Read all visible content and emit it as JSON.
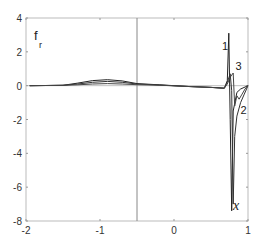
{
  "chart_data": {
    "type": "line",
    "title": "",
    "xlabel": "x",
    "ylabel_main": "f",
    "ylabel_sub": "r",
    "xlim": [
      -2,
      1
    ],
    "ylim": [
      -8,
      4
    ],
    "xticks": [
      -2,
      -1,
      0,
      1
    ],
    "yticks": [
      -8,
      -6,
      -4,
      -2,
      0,
      2,
      4
    ],
    "xtick_labels": [
      "-2",
      "-1",
      "0",
      "1"
    ],
    "ytick_labels": [
      "-8",
      "-6",
      "-4",
      "-2",
      "0",
      "2",
      "4"
    ],
    "grid": false,
    "vertical_line_x": -0.5,
    "series": [
      {
        "name": "1",
        "x": [
          -1.95,
          -1.5,
          -1.3,
          -1.1,
          -0.9,
          -0.7,
          -0.5,
          -0.2,
          0.2,
          0.5,
          0.68,
          0.72,
          0.74,
          0.75,
          0.76,
          0.78,
          0.8,
          0.85,
          0.9,
          1.0
        ],
        "y": [
          0.0,
          0.02,
          0.15,
          0.3,
          0.35,
          0.28,
          0.12,
          0.05,
          -0.05,
          -0.1,
          -0.15,
          0.3,
          3.1,
          0.5,
          -2.0,
          -7.4,
          -1.5,
          -0.4,
          -0.2,
          0.0
        ]
      },
      {
        "name": "2",
        "x": [
          -1.95,
          -1.5,
          -1.3,
          -1.1,
          -0.9,
          -0.7,
          -0.5,
          -0.2,
          0.2,
          0.5,
          0.68,
          0.72,
          0.76,
          0.78,
          0.8,
          0.82,
          0.85,
          0.9,
          0.95,
          1.0
        ],
        "y": [
          0.0,
          0.02,
          0.1,
          0.2,
          0.25,
          0.2,
          0.1,
          0.04,
          -0.05,
          -0.1,
          -0.15,
          0.2,
          0.7,
          -0.3,
          -7.0,
          -3.0,
          -1.8,
          -1.0,
          -0.5,
          0.0
        ]
      },
      {
        "name": "3",
        "x": [
          -1.95,
          -1.5,
          -1.3,
          -1.1,
          -0.9,
          -0.7,
          -0.5,
          -0.2,
          0.2,
          0.5,
          0.68,
          0.72,
          0.76,
          0.8,
          0.82,
          0.85,
          0.88,
          0.92,
          0.96,
          1.0
        ],
        "y": [
          0.0,
          0.02,
          0.05,
          0.1,
          0.12,
          0.1,
          0.06,
          0.03,
          -0.05,
          -0.1,
          -0.15,
          0.1,
          0.5,
          0.75,
          -1.2,
          -0.6,
          -0.8,
          -0.5,
          -0.2,
          0.0
        ]
      }
    ],
    "annotations": [
      {
        "text": "1",
        "x": 0.65,
        "y": 2.1
      },
      {
        "text": "3",
        "x": 0.83,
        "y": 0.9
      },
      {
        "text": "2",
        "x": 0.9,
        "y": -1.7
      }
    ]
  }
}
